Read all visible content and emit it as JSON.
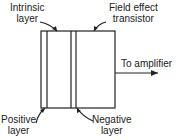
{
  "diagram": {
    "labels": {
      "intrinsic_line1": "Intrinsic",
      "intrinsic_line2": "layer",
      "fet_line1": "Field effect",
      "fet_line2": "transistor",
      "amplifier": "To amplifier",
      "positive_line1": "Positive",
      "positive_line2": "layer",
      "negative_line1": "Negative",
      "negative_line2": "layer"
    },
    "colors": {
      "stroke": "#222222",
      "background": "#ffffff"
    }
  }
}
